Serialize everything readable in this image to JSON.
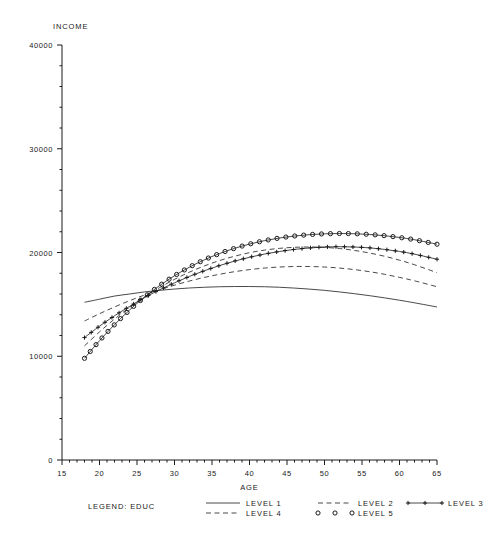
{
  "chart_data": {
    "type": "line",
    "title": "",
    "xlabel": "AGE",
    "ylabel": "INCOME",
    "xlim": [
      15,
      65
    ],
    "ylim": [
      0,
      40000
    ],
    "xticks": [
      15,
      20,
      25,
      30,
      35,
      40,
      45,
      50,
      55,
      60,
      65
    ],
    "xtick_labels": [
      "15",
      "20",
      "25",
      "30",
      "35",
      "40",
      "45",
      "50",
      "55",
      "60",
      "65"
    ],
    "yticks": [
      0,
      10000,
      20000,
      30000,
      40000
    ],
    "ytick_labels": [
      "0",
      "10000",
      "20000",
      "30000",
      "40000"
    ],
    "grid": false,
    "legend_position": "bottom",
    "legend_title": "LEGEND: EDUC",
    "x": [
      18,
      20,
      22,
      24,
      26,
      28,
      30,
      32,
      34,
      36,
      38,
      40,
      42,
      44,
      46,
      48,
      50,
      52,
      54,
      56,
      58,
      60,
      62,
      65
    ],
    "series": [
      {
        "name": "LEVEL 1",
        "style": "solid",
        "marker": "none",
        "values": [
          15200,
          15500,
          15800,
          16000,
          16200,
          16350,
          16480,
          16580,
          16650,
          16700,
          16720,
          16720,
          16700,
          16650,
          16570,
          16470,
          16350,
          16200,
          16030,
          15840,
          15630,
          15400,
          15150,
          14750
        ]
      },
      {
        "name": "LEVEL 2",
        "style": "dashed",
        "marker": "none",
        "values": [
          13400,
          14100,
          14750,
          15350,
          15900,
          16400,
          16850,
          17250,
          17600,
          17900,
          18150,
          18350,
          18500,
          18600,
          18650,
          18650,
          18600,
          18500,
          18350,
          18150,
          17900,
          17600,
          17270,
          16700
        ]
      },
      {
        "name": "LEVEL 3",
        "style": "solid",
        "marker": "plus",
        "values": [
          11800,
          12900,
          13900,
          14800,
          15650,
          16400,
          17080,
          17700,
          18250,
          18740,
          19170,
          19540,
          19850,
          20100,
          20300,
          20440,
          20530,
          20560,
          20530,
          20450,
          20300,
          20100,
          19840,
          19350
        ]
      },
      {
        "name": "LEVEL 4",
        "style": "dashed",
        "marker": "none",
        "values": [
          11000,
          12350,
          13580,
          14700,
          15710,
          16610,
          17410,
          18110,
          18710,
          19220,
          19640,
          19980,
          20230,
          20400,
          20500,
          20530,
          20490,
          20380,
          20200,
          19950,
          19640,
          19260,
          18820,
          18060
        ]
      },
      {
        "name": "LEVEL 5",
        "style": "solid",
        "marker": "circle",
        "values": [
          9800,
          11500,
          13050,
          14450,
          15700,
          16800,
          17760,
          18590,
          19300,
          19900,
          20400,
          20810,
          21140,
          21400,
          21590,
          21720,
          21800,
          21830,
          21810,
          21740,
          21620,
          21450,
          21230,
          20800
        ]
      }
    ],
    "convergence_point": {
      "age": 26.5,
      "income": 16000
    },
    "legend_entries": [
      {
        "label": "LEVEL 1",
        "style": "solid",
        "marker": "none"
      },
      {
        "label": "LEVEL 2",
        "style": "dashed",
        "marker": "none"
      },
      {
        "label": "LEVEL 3",
        "style": "solid",
        "marker": "plus"
      },
      {
        "label": "LEVEL 4",
        "style": "dashed",
        "marker": "none"
      },
      {
        "label": "LEVEL 5",
        "style": "solid",
        "marker": "circle"
      }
    ],
    "colors": {
      "ink": "#1a1a1a",
      "background": "#ffffff"
    }
  }
}
